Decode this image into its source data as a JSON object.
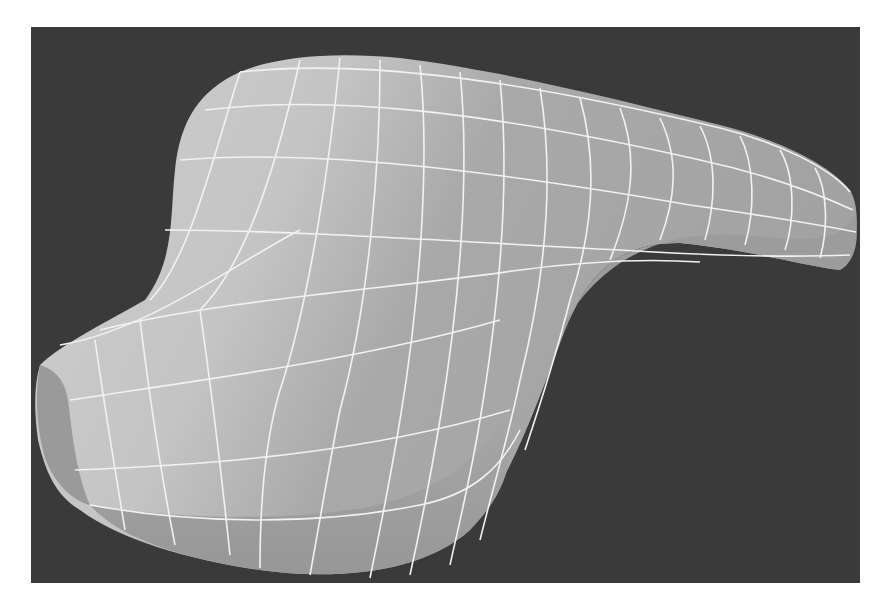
{
  "figure": {
    "colors": {
      "page_background": "#ffffff",
      "viewport_background": "#3a3a3a",
      "surface_light": "#c8c8c8",
      "surface_mid": "#a8a8a8",
      "surface_dark": "#8e8e8e",
      "wire": "#f2f2f2"
    }
  }
}
